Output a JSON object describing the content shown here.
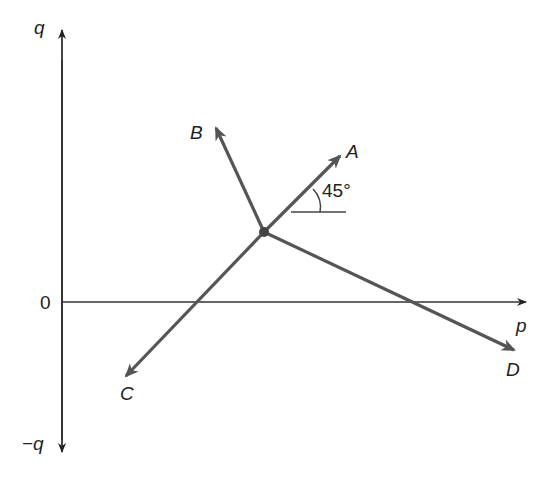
{
  "diagram": {
    "axes": {
      "vertical_top_label": "q",
      "vertical_bottom_label": "−q",
      "horizontal_label": "p",
      "origin_label": "0"
    },
    "vectors": [
      {
        "label": "A",
        "direction": "up-right"
      },
      {
        "label": "B",
        "direction": "up-left"
      },
      {
        "label": "C",
        "direction": "down-left"
      },
      {
        "label": "D",
        "direction": "down-right"
      }
    ],
    "angle_label": "45°",
    "colors": {
      "axis": "#333333",
      "vector": "#555555",
      "text": "#222222"
    }
  }
}
